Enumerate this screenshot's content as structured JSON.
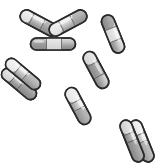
{
  "figure": {
    "description": "Grayscale illustration of rod-shaped bacteria (bacilli) arranged in four groups on a white field",
    "background_color": "#ffffff",
    "canvas": {
      "width": 162,
      "height": 168
    },
    "outline_color": "#2b2b2b",
    "fill_light": "#e8e8e8",
    "fill_mid": "#b8b8b8",
    "fill_dark": "#8f8f8f",
    "band_color": "#5a5a5a",
    "highlight_color": "#ffffff"
  },
  "groups": [
    {
      "id": "triangle-cluster",
      "label": "Triangle cluster",
      "position": "upper-left",
      "cell_count": 3,
      "cells": [
        {
          "id": "triangle-rod-left",
          "label": "Triangle left rod",
          "cx": 39,
          "cy": 23,
          "length": 41,
          "width": 13,
          "rotation": 28,
          "bands": 3
        },
        {
          "id": "triangle-rod-right",
          "label": "Triangle right rod",
          "cx": 68,
          "cy": 23,
          "length": 41,
          "width": 13,
          "rotation": -28,
          "bands": 3
        },
        {
          "id": "triangle-rod-base",
          "label": "Triangle base rod",
          "cx": 53,
          "cy": 44,
          "length": 45,
          "width": 12,
          "rotation": 0,
          "bands": 3
        }
      ]
    },
    {
      "id": "left-pair",
      "label": "Left parallel pair",
      "position": "mid-left",
      "cell_count": 2,
      "cells": [
        {
          "id": "left-pair-rod-upper",
          "label": "Left pair upper rod",
          "cx": 23,
          "cy": 74,
          "length": 42,
          "width": 12,
          "rotation": 40,
          "bands": 3
        },
        {
          "id": "left-pair-rod-lower",
          "label": "Left pair lower rod",
          "cx": 19,
          "cy": 84,
          "length": 42,
          "width": 12,
          "rotation": 40,
          "bands": 3
        }
      ]
    },
    {
      "id": "center-chain",
      "label": "Center diagonal chain",
      "position": "center",
      "cell_count": 3,
      "cells": [
        {
          "id": "chain-rod-top",
          "label": "Chain top rod",
          "cx": 113,
          "cy": 34,
          "length": 40,
          "width": 13,
          "rotation": 68,
          "bands": 3
        },
        {
          "id": "chain-rod-middle",
          "label": "Chain middle rod",
          "cx": 96,
          "cy": 70,
          "length": 40,
          "width": 13,
          "rotation": 62,
          "bands": 3
        },
        {
          "id": "chain-rod-bottom",
          "label": "Chain bottom rod",
          "cx": 78,
          "cy": 106,
          "length": 40,
          "width": 13,
          "rotation": 62,
          "bands": 3
        }
      ]
    },
    {
      "id": "bottom-right-pair",
      "label": "Bottom-right parallel pair",
      "position": "bottom-right",
      "cell_count": 2,
      "cells": [
        {
          "id": "br-pair-rod-left",
          "label": "Bottom-right left rod",
          "cx": 132,
          "cy": 141,
          "length": 44,
          "width": 12,
          "rotation": 68,
          "bands": 3
        },
        {
          "id": "br-pair-rod-right",
          "label": "Bottom-right right rod",
          "cx": 142,
          "cy": 141,
          "length": 44,
          "width": 12,
          "rotation": 68,
          "bands": 3
        }
      ]
    }
  ],
  "totals": {
    "group_count": 4,
    "cell_count": 10
  }
}
